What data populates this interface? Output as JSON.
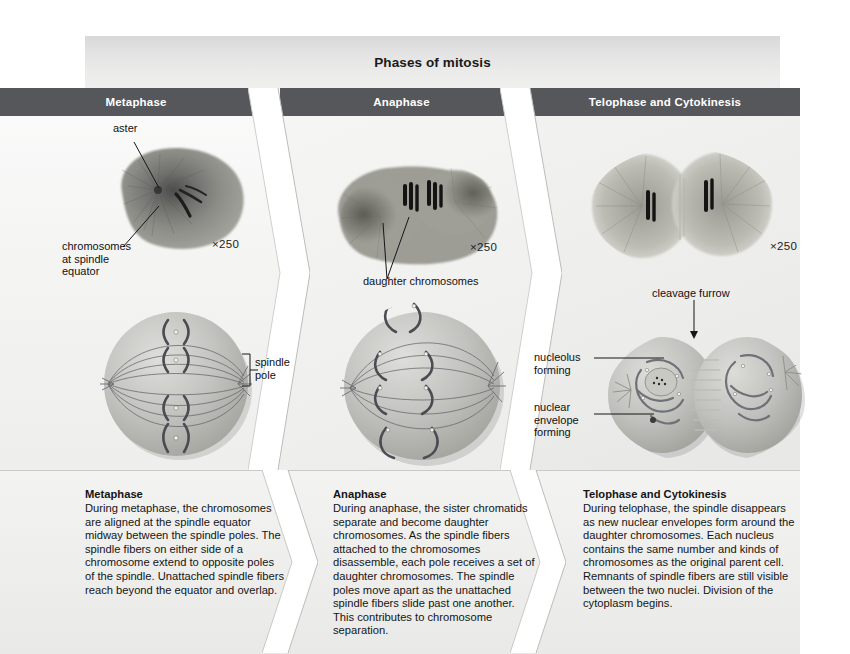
{
  "figure": {
    "title": "Phases of mitosis",
    "accent_bar_color": "#56575a",
    "title_bar_color": "#e6e6e5",
    "page_background": "#ffffff"
  },
  "panels": [
    {
      "id": "metaphase",
      "header": "Metaphase",
      "micrograph": {
        "magnification": "×250",
        "callouts": [
          {
            "name": "aster",
            "text": "aster"
          },
          {
            "name": "chromosomes-at-spindle-equator",
            "text": "chromosomes\nat spindle\nequator"
          }
        ]
      },
      "diagram": {
        "callouts": [
          {
            "name": "spindle-pole",
            "text": "spindle\npole"
          }
        ]
      },
      "caption": {
        "title": "Metaphase",
        "body": "During metaphase, the chromosomes are aligned at the spindle equator midway between the spindle poles. The spindle fibers on either side of a chromosome extend to opposite poles of the spindle. Unattached spindle fibers reach beyond the equator and overlap."
      }
    },
    {
      "id": "anaphase",
      "header": "Anaphase",
      "micrograph": {
        "magnification": "×250",
        "callouts": [
          {
            "name": "daughter-chromosomes",
            "text": "daughter chromosomes"
          }
        ]
      },
      "diagram": {
        "callouts": []
      },
      "caption": {
        "title": "Anaphase",
        "body": "During anaphase, the sister chromatids separate and become daughter chromosomes. As the spindle fibers attached to the chromosomes disassemble, each pole receives a set of daughter chromosomes. The spindle poles move apart as the unattached spindle fibers slide past one another. This contributes to chromosome separation."
      }
    },
    {
      "id": "telophase-and-cytokinesis",
      "header": "Telophase and Cytokinesis",
      "micrograph": {
        "magnification": "×250",
        "callouts": []
      },
      "diagram": {
        "callouts": [
          {
            "name": "cleavage-furrow",
            "text": "cleavage furrow"
          },
          {
            "name": "nucleolus-forming",
            "text": "nucleolus\nforming"
          },
          {
            "name": "nuclear-envelope-forming",
            "text": "nuclear\nenvelope\nforming"
          }
        ]
      },
      "caption": {
        "title": "Telophase and Cytokinesis",
        "body": "During telophase, the spindle disappears as new nuclear envelopes form around the daughter chromosomes. Each nucleus contains the same number and kinds of chromosomes as the original parent cell. Remnants of spindle fibers are still visible between the two nuclei. Division of the cytoplasm begins."
      }
    }
  ]
}
